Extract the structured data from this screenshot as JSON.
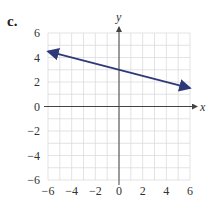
{
  "panel_label": "c.",
  "colors": {
    "line": "#2e3a78",
    "grid": "#dcdcdc",
    "axis": "#444444"
  },
  "chart_data": {
    "type": "line",
    "title": "",
    "xlabel": "x",
    "ylabel": "y",
    "xlim": [
      -6,
      6
    ],
    "ylim": [
      -6,
      6
    ],
    "grid": true,
    "xticks": [
      -6,
      -4,
      -2,
      0,
      2,
      4,
      6
    ],
    "yticks": [
      -6,
      -4,
      -2,
      0,
      2,
      4,
      6
    ],
    "series": [
      {
        "name": "line",
        "x": [
          -6,
          6
        ],
        "y": [
          4.5,
          1.5
        ],
        "arrows": "both",
        "equation": "y = -0.25x + 3"
      }
    ]
  }
}
